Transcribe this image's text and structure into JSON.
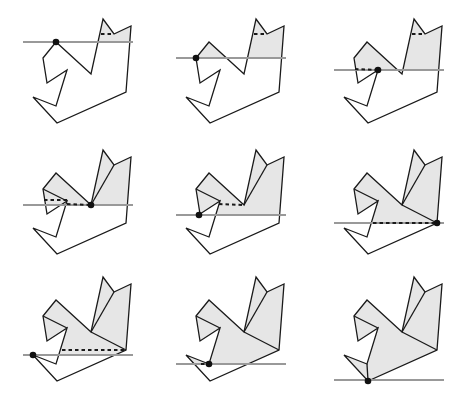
{
  "figure": {
    "title": "",
    "colors": {
      "shade": "#e6e6e6",
      "edge": "#1a1a1a",
      "sweep_line": "#999999",
      "event_point": "#111111"
    },
    "polygon": [
      [
        103,
        19
      ],
      [
        114,
        34
      ],
      [
        131,
        26
      ],
      [
        126,
        92
      ],
      [
        57,
        123
      ],
      [
        33,
        97
      ],
      [
        56,
        106
      ],
      [
        67,
        70
      ],
      [
        47,
        83
      ],
      [
        43,
        58
      ],
      [
        56,
        42
      ],
      [
        91,
        74
      ]
    ],
    "sweep_x_range": [
      23,
      133
    ],
    "grid": {
      "col_offsets": [
        0,
        153,
        311
      ],
      "row_offsets": [
        0,
        131,
        258
      ]
    },
    "panels": [
      {
        "label": "step-1",
        "sweep_y": 42,
        "event": [
          56,
          42
        ],
        "diagonals": [],
        "dashed": [
          [
            [
              101,
              34
            ],
            [
              114,
              34
            ]
          ]
        ]
      },
      {
        "label": "step-2",
        "sweep_y": 58,
        "event": [
          43,
          58
        ],
        "diagonals": [],
        "dashed": [
          [
            [
              101,
              34
            ],
            [
              114,
              34
            ]
          ]
        ]
      },
      {
        "label": "step-3",
        "sweep_y": 70,
        "event": [
          67,
          70
        ],
        "diagonals": [],
        "dashed": [
          [
            [
              101,
              34
            ],
            [
              114,
              34
            ]
          ],
          [
            [
              44,
              69
            ],
            [
              67,
              70
            ]
          ]
        ]
      },
      {
        "label": "step-4",
        "sweep_y": 74,
        "event": [
          91,
          74
        ],
        "diagonals": [
          [
            [
              91,
              74
            ],
            [
              114,
              34
            ]
          ],
          [
            [
              43,
              58
            ],
            [
              67,
              70
            ]
          ]
        ],
        "dashed": [
          [
            [
              44,
              69
            ],
            [
              67,
              69
            ]
          ],
          [
            [
              67,
              73
            ],
            [
              91,
              74
            ]
          ]
        ]
      },
      {
        "label": "step-5",
        "sweep_y": 84,
        "event": [
          46,
          84
        ],
        "diagonals": [
          [
            [
              91,
              74
            ],
            [
              114,
              34
            ]
          ],
          [
            [
              43,
              58
            ],
            [
              67,
              70
            ]
          ]
        ],
        "dashed": [
          [
            [
              66,
              73
            ],
            [
              91,
              74
            ]
          ]
        ]
      },
      {
        "label": "step-6",
        "sweep_y": 92,
        "event": [
          126,
          92
        ],
        "diagonals": [
          [
            [
              91,
              74
            ],
            [
              114,
              34
            ]
          ],
          [
            [
              43,
              58
            ],
            [
              67,
              70
            ]
          ],
          [
            [
              91,
              74
            ],
            [
              126,
              92
            ]
          ]
        ],
        "dashed": [
          [
            [
              62,
              92
            ],
            [
              126,
              92
            ]
          ]
        ]
      },
      {
        "label": "step-7",
        "sweep_y": 97,
        "event": [
          33,
          97
        ],
        "diagonals": [
          [
            [
              91,
              74
            ],
            [
              114,
              34
            ]
          ],
          [
            [
              43,
              58
            ],
            [
              67,
              70
            ]
          ],
          [
            [
              91,
              74
            ],
            [
              126,
              92
            ]
          ]
        ],
        "dashed": [
          [
            [
              62,
              92
            ],
            [
              126,
              92
            ]
          ]
        ]
      },
      {
        "label": "step-8",
        "sweep_y": 106,
        "event": [
          56,
          106
        ],
        "diagonals": [
          [
            [
              91,
              74
            ],
            [
              114,
              34
            ]
          ],
          [
            [
              43,
              58
            ],
            [
              67,
              70
            ]
          ],
          [
            [
              91,
              74
            ],
            [
              126,
              92
            ]
          ]
        ],
        "dashed": [
          [
            [
              48,
              106
            ],
            [
              56,
              106
            ]
          ]
        ]
      },
      {
        "label": "step-9",
        "sweep_y": 122,
        "event": [
          57,
          123
        ],
        "diagonals": [
          [
            [
              91,
              74
            ],
            [
              114,
              34
            ]
          ],
          [
            [
              43,
              58
            ],
            [
              67,
              70
            ]
          ],
          [
            [
              91,
              74
            ],
            [
              126,
              92
            ]
          ],
          [
            [
              57,
              123
            ],
            [
              56,
              106
            ]
          ]
        ],
        "dashed": []
      }
    ]
  }
}
